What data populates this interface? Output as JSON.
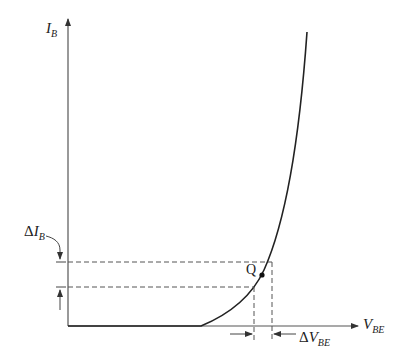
{
  "diagram": {
    "colors": {
      "axis": "#555555",
      "curve": "#222222",
      "dash": "#555555",
      "text": "#222222"
    },
    "y_axis": {
      "label_main": "I",
      "label_sub": "B"
    },
    "x_axis": {
      "label_main": "V",
      "label_sub": "BE"
    },
    "delta_ib": {
      "label_prefix": "Δ",
      "label_main": "I",
      "label_sub": "B"
    },
    "delta_vbe": {
      "label_prefix": "Δ",
      "label_main": "V",
      "label_sub": "BE"
    },
    "q_point": {
      "label": "Q"
    }
  }
}
